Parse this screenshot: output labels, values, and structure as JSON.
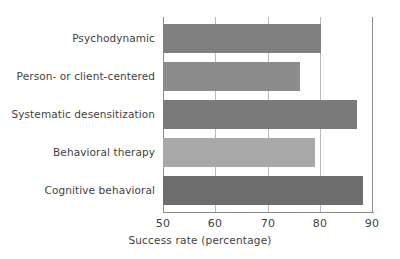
{
  "chart_data": {
    "type": "bar",
    "orientation": "horizontal",
    "title": "",
    "subtitle": "",
    "xlabel": "Success rate (percentage)",
    "ylabel": "",
    "categories": [
      "Psychodynamic",
      "Person- or client-centered",
      "Systematic desensitization",
      "Behavioral therapy",
      "Cognitive behavioral"
    ],
    "values": [
      80,
      76,
      87,
      79,
      88
    ],
    "bar_colors": [
      "#808080",
      "#8c8c8c",
      "#7a7a7a",
      "#a8a8a8",
      "#6e6e6e"
    ],
    "xlim": [
      50,
      90
    ],
    "ylim": [
      0,
      5
    ],
    "xticks": [
      50,
      60,
      70,
      80,
      90
    ],
    "xticklabels": [
      "50",
      "60",
      "70",
      "80",
      "90"
    ],
    "grid": "vertical",
    "legend": "none",
    "annotations": []
  },
  "axis": {
    "x_title": "Success rate (percentage)",
    "tick_50": "50",
    "tick_60": "60",
    "tick_70": "70",
    "tick_80": "80",
    "tick_90": "90"
  },
  "bars": [
    {
      "label": "Psychodynamic",
      "value": 80
    },
    {
      "label": "Person- or client-centered",
      "value": 76
    },
    {
      "label": "Systematic desensitization",
      "value": 87
    },
    {
      "label": "Behavioral therapy",
      "value": 79
    },
    {
      "label": "Cognitive behavioral",
      "value": 88
    }
  ],
  "colors": {
    "bar_1": "#808080",
    "bar_2": "#8c8c8c",
    "bar_3": "#7a7a7a",
    "bar_4": "#a8a8a8",
    "bar_5": "#6e6e6e",
    "grid": "#b9b9b9",
    "spine": "#8d8d8d",
    "text": "#3f3f3f",
    "background": "#ffffff"
  }
}
